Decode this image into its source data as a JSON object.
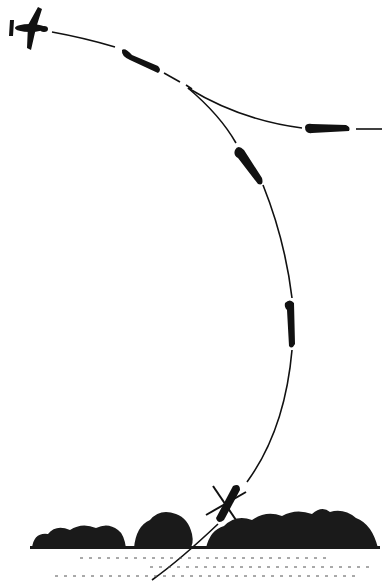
{
  "diagram": {
    "type": "maneuver-illustration",
    "colors": {
      "ink": "#111111",
      "background": "#ffffff",
      "foliage": "#1a1a1a"
    },
    "elements": [
      {
        "id": "fighter-top-left",
        "label": "fighter plane (top view)"
      },
      {
        "id": "plane-pos-1",
        "label": "plane banking"
      },
      {
        "id": "plane-breakoff",
        "label": "plane breaking off level"
      },
      {
        "id": "plane-pos-2",
        "label": "plane diving"
      },
      {
        "id": "plane-pos-3",
        "label": "plane vertical dive"
      },
      {
        "id": "plane-crash",
        "label": "plane crashing"
      },
      {
        "id": "treeline",
        "label": "treeline / ground"
      }
    ]
  }
}
